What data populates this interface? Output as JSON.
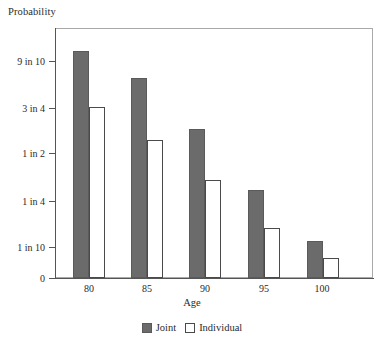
{
  "chart_data": {
    "type": "bar",
    "title": "",
    "ylabel": "Probability",
    "xlabel": "Age",
    "categories": [
      "80",
      "85",
      "90",
      "95",
      "100"
    ],
    "series": [
      {
        "name": "Joint",
        "color": "#6b6b6b",
        "values": [
          0.93,
          0.83,
          0.62,
          0.3,
          0.12
        ]
      },
      {
        "name": "Individual",
        "color": "#ffffff",
        "values": [
          0.75,
          0.55,
          0.33,
          0.17,
          0.075
        ]
      }
    ],
    "ytick_labels": [
      "9 in 10",
      "3 in 4",
      "1 in 2",
      "1 in 4",
      "1 in 10",
      "0"
    ],
    "ytick_values": [
      0.9,
      0.75,
      0.5,
      0.25,
      0.1,
      0
    ],
    "ylim": [
      0,
      1
    ],
    "grid": false,
    "legend_position": "bottom",
    "y_scale": "nonlinear-probability"
  },
  "axes": {
    "y_title": "Probability",
    "x_title": "Age",
    "y_ticks": [
      {
        "label": "9 in 10",
        "y": 61
      },
      {
        "label": "3 in 4",
        "y": 108
      },
      {
        "label": "1 in 2",
        "y": 153
      },
      {
        "label": "1 in 4",
        "y": 201
      },
      {
        "label": "1 in 10",
        "y": 247
      },
      {
        "label": "0",
        "y": 278
      }
    ],
    "x_ticks": [
      {
        "label": "80",
        "x": 89
      },
      {
        "label": "85",
        "x": 147
      },
      {
        "label": "90",
        "x": 205
      },
      {
        "label": "95",
        "x": 264
      },
      {
        "label": "100",
        "x": 322
      }
    ]
  },
  "bars": [
    {
      "group": "80",
      "series": "Joint",
      "x": 73,
      "width": 16,
      "top": 51,
      "value": 0.93
    },
    {
      "group": "80",
      "series": "Individual",
      "x": 89,
      "width": 16,
      "top": 107,
      "value": 0.75
    },
    {
      "group": "85",
      "series": "Joint",
      "x": 131,
      "width": 16,
      "top": 78,
      "value": 0.83
    },
    {
      "group": "85",
      "series": "Individual",
      "x": 147,
      "width": 16,
      "top": 140,
      "value": 0.55
    },
    {
      "group": "90",
      "series": "Joint",
      "x": 189,
      "width": 16,
      "top": 129,
      "value": 0.62
    },
    {
      "group": "90",
      "series": "Individual",
      "x": 205,
      "width": 16,
      "top": 180,
      "value": 0.33
    },
    {
      "group": "95",
      "series": "Joint",
      "x": 248,
      "width": 16,
      "top": 190,
      "value": 0.3
    },
    {
      "group": "95",
      "series": "Individual",
      "x": 264,
      "width": 16,
      "top": 228,
      "value": 0.17
    },
    {
      "group": "100",
      "series": "Joint",
      "x": 307,
      "width": 16,
      "top": 241,
      "value": 0.12
    },
    {
      "group": "100",
      "series": "Individual",
      "x": 323,
      "width": 16,
      "top": 258,
      "value": 0.075
    }
  ],
  "legend": {
    "entries": [
      {
        "label": "Joint",
        "swatch": "joint"
      },
      {
        "label": "Individual",
        "swatch": "individual"
      }
    ]
  },
  "layout": {
    "baseline_y": 278,
    "plot_left": 55,
    "plot_top": 28,
    "plot_right": 373
  }
}
